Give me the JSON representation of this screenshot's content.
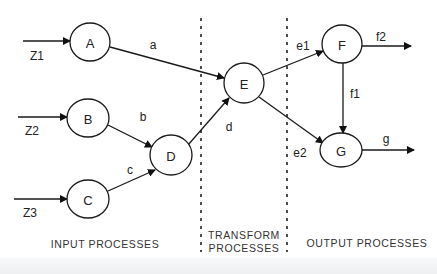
{
  "diagram": {
    "nodes": [
      {
        "id": "A",
        "label": "A"
      },
      {
        "id": "B",
        "label": "B"
      },
      {
        "id": "C",
        "label": "C"
      },
      {
        "id": "D",
        "label": "D"
      },
      {
        "id": "E",
        "label": "E"
      },
      {
        "id": "F",
        "label": "F"
      },
      {
        "id": "G",
        "label": "G"
      }
    ],
    "edges": [
      {
        "from": "Z1",
        "to": "A",
        "label": "Z1"
      },
      {
        "from": "Z2",
        "to": "B",
        "label": "Z2"
      },
      {
        "from": "Z3",
        "to": "C",
        "label": "Z3"
      },
      {
        "from": "A",
        "to": "E",
        "label": "a"
      },
      {
        "from": "B",
        "to": "D",
        "label": "b"
      },
      {
        "from": "C",
        "to": "D",
        "label": "c"
      },
      {
        "from": "D",
        "to": "E",
        "label": "d"
      },
      {
        "from": "E",
        "to": "F",
        "label": "e1"
      },
      {
        "from": "E",
        "to": "G",
        "label": "e2"
      },
      {
        "from": "F",
        "to": "G",
        "label": "f1"
      },
      {
        "from": "F",
        "to": "out",
        "label": "f2"
      },
      {
        "from": "G",
        "to": "out",
        "label": "g"
      }
    ],
    "sections": {
      "input": "INPUT PROCESSES",
      "transform_line1": "TRANSFORM",
      "transform_line2": "PROCESSES",
      "output": "OUTPUT PROCESSES"
    }
  }
}
